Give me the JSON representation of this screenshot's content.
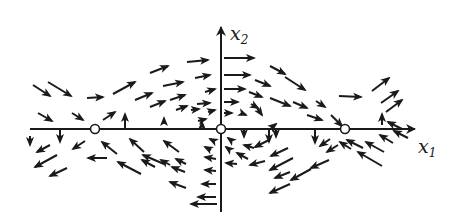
{
  "figure": {
    "type": "phase-portrait",
    "stroke_color": "#1a1a1a",
    "background": "#ffffff",
    "axes": {
      "x1": {
        "label": "x",
        "subscript": "1",
        "from": [
          30,
          129
        ],
        "to": [
          415,
          129
        ]
      },
      "x2": {
        "label": "x",
        "subscript": "2",
        "from": [
          221,
          212
        ],
        "to": [
          221,
          27
        ]
      }
    },
    "equilibria": [
      {
        "x": 95,
        "y": 129
      },
      {
        "x": 221,
        "y": 129
      },
      {
        "x": 345,
        "y": 129
      }
    ],
    "arrows": [
      [
        33,
        85,
        50,
        96
      ],
      [
        48,
        82,
        71,
        96
      ],
      [
        87,
        98,
        103,
        97
      ],
      [
        113,
        94,
        135,
        82
      ],
      [
        150,
        73,
        168,
        66
      ],
      [
        187,
        62,
        208,
        60
      ],
      [
        135,
        100,
        152,
        93
      ],
      [
        163,
        86,
        183,
        82
      ],
      [
        195,
        78,
        210,
        75
      ],
      [
        205,
        92,
        215,
        89
      ],
      [
        170,
        100,
        185,
        95
      ],
      [
        150,
        107,
        165,
        101
      ],
      [
        197,
        104,
        210,
        103
      ],
      [
        208,
        112,
        215,
        110
      ],
      [
        176,
        110,
        187,
        106
      ],
      [
        198,
        121,
        206,
        119
      ],
      [
        191,
        110,
        199,
        109
      ],
      [
        38,
        113,
        52,
        121
      ],
      [
        72,
        113,
        83,
        120
      ],
      [
        103,
        120,
        115,
        112
      ],
      [
        125,
        128,
        125,
        114
      ],
      [
        164,
        124,
        164,
        118
      ],
      [
        202,
        126,
        202,
        122
      ],
      [
        224,
        58,
        254,
        58
      ],
      [
        224,
        75,
        250,
        75
      ],
      [
        224,
        89,
        245,
        89
      ],
      [
        224,
        102,
        238,
        102
      ],
      [
        224,
        113,
        232,
        113
      ],
      [
        270,
        66,
        285,
        74
      ],
      [
        255,
        80,
        270,
        86
      ],
      [
        285,
        77,
        305,
        90
      ],
      [
        249,
        92,
        262,
        97
      ],
      [
        270,
        98,
        290,
        106
      ],
      [
        251,
        104,
        258,
        108
      ],
      [
        241,
        113,
        246,
        115
      ],
      [
        257,
        108,
        262,
        115
      ],
      [
        293,
        102,
        307,
        108
      ],
      [
        316,
        101,
        325,
        107
      ],
      [
        331,
        115,
        342,
        126
      ],
      [
        307,
        115,
        322,
        120
      ],
      [
        339,
        96,
        361,
        97
      ],
      [
        372,
        91,
        389,
        78
      ],
      [
        381,
        103,
        398,
        91
      ],
      [
        386,
        112,
        402,
        100
      ],
      [
        382,
        125,
        382,
        114
      ],
      [
        30,
        136,
        30,
        145
      ],
      [
        60,
        130,
        60,
        142
      ],
      [
        269,
        129,
        269,
        142
      ],
      [
        315,
        129,
        315,
        143
      ],
      [
        271,
        128,
        276,
        124
      ],
      [
        244,
        130,
        244,
        137
      ],
      [
        276,
        130,
        276,
        137
      ],
      [
        50,
        145,
        37,
        152
      ],
      [
        85,
        141,
        73,
        149
      ],
      [
        57,
        155,
        35,
        167
      ],
      [
        67,
        168,
        50,
        176
      ],
      [
        107,
        158,
        88,
        158
      ],
      [
        117,
        154,
        102,
        142
      ],
      [
        144,
        152,
        130,
        139
      ],
      [
        179,
        152,
        164,
        141
      ],
      [
        164,
        164,
        143,
        155
      ],
      [
        155,
        167,
        142,
        160
      ],
      [
        141,
        174,
        118,
        162
      ],
      [
        170,
        165,
        161,
        160
      ],
      [
        186,
        164,
        176,
        159
      ],
      [
        185,
        172,
        172,
        167
      ],
      [
        186,
        188,
        170,
        182
      ],
      [
        214,
        141,
        210,
        139
      ],
      [
        211,
        150,
        205,
        147
      ],
      [
        232,
        141,
        228,
        138
      ],
      [
        230,
        150,
        226,
        147
      ],
      [
        216,
        159,
        205,
        157
      ],
      [
        216,
        171,
        205,
        170
      ],
      [
        216,
        184,
        202,
        184
      ],
      [
        216,
        197,
        198,
        197
      ],
      [
        217,
        204,
        191,
        204
      ],
      [
        237,
        164,
        226,
        163
      ],
      [
        248,
        159,
        237,
        153
      ],
      [
        254,
        148,
        244,
        145
      ],
      [
        269,
        140,
        255,
        147
      ],
      [
        265,
        161,
        250,
        165
      ],
      [
        288,
        148,
        271,
        156
      ],
      [
        293,
        158,
        270,
        170
      ],
      [
        290,
        172,
        275,
        178
      ],
      [
        311,
        169,
        291,
        180
      ],
      [
        290,
        184,
        270,
        193
      ],
      [
        330,
        139,
        320,
        146
      ],
      [
        329,
        160,
        311,
        168
      ],
      [
        338,
        145,
        327,
        152
      ],
      [
        351,
        149,
        340,
        142
      ],
      [
        363,
        148,
        347,
        140
      ],
      [
        382,
        166,
        358,
        152
      ],
      [
        384,
        152,
        366,
        142
      ],
      [
        393,
        143,
        380,
        135
      ],
      [
        402,
        129,
        388,
        122
      ],
      [
        408,
        138,
        394,
        131
      ]
    ]
  }
}
